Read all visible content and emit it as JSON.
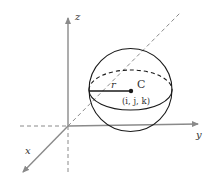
{
  "figure": {
    "axes": {
      "x_label": "x",
      "y_label": "y",
      "z_label": "z"
    },
    "sphere": {
      "center_label": "C",
      "center_coords": "(i, j, k)",
      "radius_label": "r"
    }
  }
}
